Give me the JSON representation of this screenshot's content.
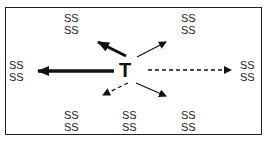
{
  "diagram": {
    "center_label": "T",
    "nodes": [
      {
        "id": "top-left",
        "lines": [
          "SS",
          "SS"
        ],
        "x": 64,
        "y": 12
      },
      {
        "id": "top-right",
        "lines": [
          "SS",
          "SS"
        ],
        "x": 181,
        "y": 12
      },
      {
        "id": "left",
        "lines": [
          "SS",
          "SS"
        ],
        "x": 9,
        "y": 59
      },
      {
        "id": "right",
        "lines": [
          "SS",
          "SS"
        ],
        "x": 240,
        "y": 59
      },
      {
        "id": "bottom-left",
        "lines": [
          "SS",
          "SS"
        ],
        "x": 64,
        "y": 109
      },
      {
        "id": "bottom-center",
        "lines": [
          "SS",
          "SS"
        ],
        "x": 122,
        "y": 109
      },
      {
        "id": "bottom-right",
        "lines": [
          "SS",
          "SS"
        ],
        "x": 181,
        "y": 109
      }
    ],
    "arrows": [
      {
        "direction": "left",
        "style": "thick-solid"
      },
      {
        "direction": "up-left",
        "style": "thick-solid"
      },
      {
        "direction": "up-right",
        "style": "thin-solid"
      },
      {
        "direction": "right",
        "style": "dashed"
      },
      {
        "direction": "down-left",
        "style": "dashed"
      },
      {
        "direction": "down-right",
        "style": "thin-solid"
      }
    ]
  }
}
